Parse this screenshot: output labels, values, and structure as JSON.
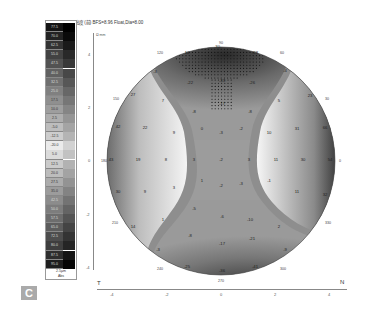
{
  "header": {
    "title": "高度 (前) BFS=8.96 Float,Dia=8.00"
  },
  "panel_label": "C",
  "scale": {
    "values": [
      "77.5",
      "70.0",
      "62.5",
      "55.0",
      "47.5",
      "40.0",
      "32.5",
      "25.0",
      "17.5",
      "10.0",
      "2.5",
      "-5.0",
      "-12.5",
      "-20.0",
      "5.0",
      "12.5",
      "20.0",
      "27.5",
      "35.0",
      "42.5",
      "50.0",
      "57.5",
      "65.0",
      "72.5",
      "80.0",
      "87.5",
      "95.0"
    ],
    "step": "2.5µm",
    "mode": "Abs"
  },
  "axes": {
    "unit_label": "Ω mm",
    "y_ticks": [
      "4",
      "2",
      "0",
      "-2",
      "-4"
    ],
    "x_ticks": [
      "-4",
      "-2",
      "0",
      "2",
      "4"
    ],
    "left_label": "T",
    "right_label": "N"
  },
  "rim_labels": {
    "top": "90",
    "top_left": "120",
    "top_right": "60",
    "left_upper": "150",
    "right_upper": "30",
    "left": "180",
    "right": "0",
    "left_lower": "210",
    "right_lower": "330",
    "bottom_left": "240",
    "bottom_right": "300",
    "bottom": "270"
  },
  "map_values": [
    {
      "x": 187,
      "y": 54,
      "v": "10"
    },
    {
      "x": 217,
      "y": 48,
      "v": "-30"
    },
    {
      "x": 255,
      "y": 54,
      "v": "-28"
    },
    {
      "x": 155,
      "y": 73,
      "v": "-3"
    },
    {
      "x": 190,
      "y": 84,
      "v": "-22"
    },
    {
      "x": 222,
      "y": 82,
      "v": "-33"
    },
    {
      "x": 252,
      "y": 84,
      "v": "-26"
    },
    {
      "x": 285,
      "y": 72,
      "v": "-4"
    },
    {
      "x": 133,
      "y": 96,
      "v": "27"
    },
    {
      "x": 163,
      "y": 102,
      "v": "7"
    },
    {
      "x": 222,
      "y": 105,
      "v": "-17"
    },
    {
      "x": 194,
      "y": 113,
      "v": "-8"
    },
    {
      "x": 250,
      "y": 113,
      "v": "-8"
    },
    {
      "x": 279,
      "y": 102,
      "v": "5"
    },
    {
      "x": 310,
      "y": 97,
      "v": "23"
    },
    {
      "x": 118,
      "y": 128,
      "v": "42"
    },
    {
      "x": 145,
      "y": 129,
      "v": "22"
    },
    {
      "x": 174,
      "y": 134,
      "v": "9"
    },
    {
      "x": 202,
      "y": 130,
      "v": "0"
    },
    {
      "x": 221,
      "y": 134,
      "v": "-3"
    },
    {
      "x": 241,
      "y": 130,
      "v": "-2"
    },
    {
      "x": 269,
      "y": 134,
      "v": "10"
    },
    {
      "x": 297,
      "y": 130,
      "v": "31"
    },
    {
      "x": 325,
      "y": 129,
      "v": "66"
    },
    {
      "x": 111,
      "y": 161,
      "v": "43"
    },
    {
      "x": 138,
      "y": 161,
      "v": "19"
    },
    {
      "x": 166,
      "y": 161,
      "v": "8"
    },
    {
      "x": 194,
      "y": 161,
      "v": "3"
    },
    {
      "x": 221,
      "y": 161,
      "v": "-2"
    },
    {
      "x": 249,
      "y": 161,
      "v": "3"
    },
    {
      "x": 276,
      "y": 161,
      "v": "11"
    },
    {
      "x": 303,
      "y": 161,
      "v": "30"
    },
    {
      "x": 330,
      "y": 161,
      "v": "54"
    },
    {
      "x": 118,
      "y": 193,
      "v": "30"
    },
    {
      "x": 145,
      "y": 193,
      "v": "9"
    },
    {
      "x": 174,
      "y": 189,
      "v": "3"
    },
    {
      "x": 202,
      "y": 182,
      "v": "1"
    },
    {
      "x": 221,
      "y": 187,
      "v": "-2"
    },
    {
      "x": 241,
      "y": 185,
      "v": "-3"
    },
    {
      "x": 269,
      "y": 182,
      "v": "-1"
    },
    {
      "x": 297,
      "y": 193,
      "v": "11"
    },
    {
      "x": 325,
      "y": 196,
      "v": "32"
    },
    {
      "x": 133,
      "y": 228,
      "v": "14"
    },
    {
      "x": 163,
      "y": 221,
      "v": "1"
    },
    {
      "x": 194,
      "y": 210,
      "v": "-5"
    },
    {
      "x": 222,
      "y": 218,
      "v": "-6"
    },
    {
      "x": 250,
      "y": 221,
      "v": "-10"
    },
    {
      "x": 279,
      "y": 228,
      "v": "2"
    },
    {
      "x": 158,
      "y": 251,
      "v": "-3"
    },
    {
      "x": 190,
      "y": 237,
      "v": "-8"
    },
    {
      "x": 222,
      "y": 245,
      "v": "-17"
    },
    {
      "x": 252,
      "y": 240,
      "v": "-21"
    },
    {
      "x": 285,
      "y": 251,
      "v": "-9"
    },
    {
      "x": 187,
      "y": 268,
      "v": "-25"
    },
    {
      "x": 222,
      "y": 272,
      "v": "-36"
    },
    {
      "x": 255,
      "y": 268,
      "v": "-41"
    }
  ]
}
